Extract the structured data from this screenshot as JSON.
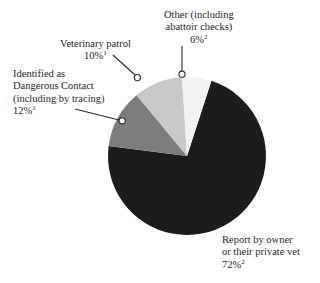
{
  "chart_data": {
    "type": "pie",
    "title": "",
    "subtitle": "",
    "xlabel": "",
    "ylabel": "",
    "legend_position": "none",
    "grid": false,
    "units": "percent",
    "start_angle_deg": 18,
    "direction": "clockwise",
    "categories": [
      "Report by owner or their private vet",
      "Identified as Dangerous Contact (including by tracing)",
      "Veterinary patrol",
      "Other (including abattoir checks)"
    ],
    "values": [
      72,
      12,
      10,
      6
    ],
    "colors": [
      "#1c1c1c",
      "#7d7d7d",
      "#c9c9c9",
      "#f2f2f2"
    ],
    "footnote_markers": [
      "2",
      "1",
      "1",
      "2"
    ],
    "slices": [
      {
        "name": "Report by owner or their private vet",
        "value": 72,
        "value_label": "72%",
        "footnote": "2",
        "color": "#1c1c1c"
      },
      {
        "name": "Identified as Dangerous Contact (including by tracing)",
        "value": 12,
        "value_label": "12%",
        "footnote": "1",
        "color": "#7d7d7d"
      },
      {
        "name": "Veterinary patrol",
        "value": 10,
        "value_label": "10%",
        "footnote": "1",
        "color": "#c9c9c9"
      },
      {
        "name": "Other (including abattoir checks)",
        "value": 6,
        "value_label": "6%",
        "footnote": "2",
        "color": "#f2f2f2"
      }
    ]
  },
  "labels": {
    "other": {
      "line1": "Other (including",
      "line2": "abattoir checks)",
      "value": "6%",
      "footnote": "2"
    },
    "veterinary_patrol": {
      "line1": "Veterinary patrol",
      "value": "10%",
      "footnote": "1"
    },
    "dangerous_contact": {
      "line1": "Identified as",
      "line2": "Dangerous Contact",
      "line3": "(including by tracing)",
      "value": "12%",
      "footnote": "1"
    },
    "report_by_owner": {
      "line1": "Report by owner",
      "line2": "or their private vet",
      "value": "72%",
      "footnote": "2"
    }
  }
}
